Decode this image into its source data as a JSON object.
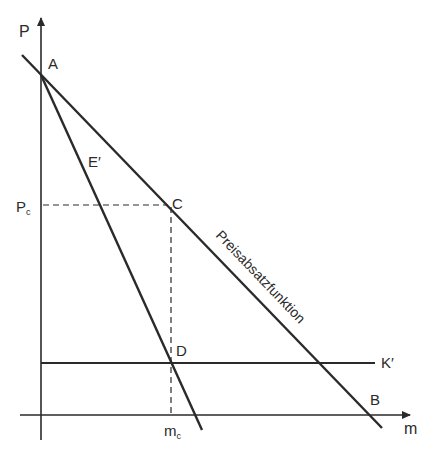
{
  "diagram": {
    "type": "economics-price-quantity",
    "axes": {
      "y_label": "P",
      "x_label": "m"
    },
    "points": {
      "A": "A",
      "B": "B",
      "C": "C",
      "D": "D"
    },
    "curves": {
      "demand_label": "Preisabsatzfunktion",
      "marginal_revenue_label": "E′",
      "marginal_cost_label": "K′"
    },
    "ticks": {
      "price_main": "P",
      "price_sub": "c",
      "quantity_main": "m",
      "quantity_sub": "c"
    },
    "colors": {
      "line": "#2a2a2a",
      "background": "#ffffff"
    }
  }
}
